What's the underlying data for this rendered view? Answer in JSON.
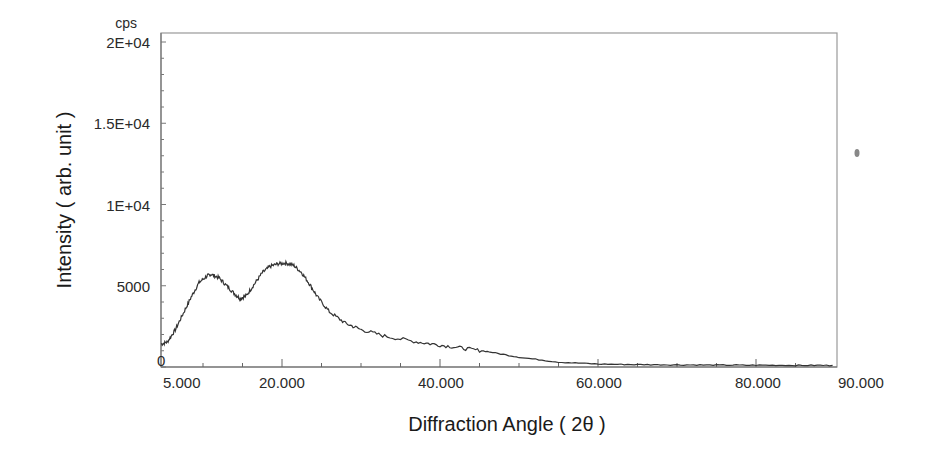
{
  "chart_data": {
    "type": "line",
    "title": "",
    "xlabel": "Diffraction Angle ( 2θ )",
    "ylabel": "Intensity ( arb. unit )",
    "y_unit": "cps",
    "xlim": [
      5,
      90
    ],
    "ylim": [
      0,
      20000
    ],
    "grid": false,
    "legend": null,
    "x_tick_labels": [
      "5.000",
      "20.000",
      "40.000",
      "60.000",
      "80.000",
      "90.000"
    ],
    "x_tick_values": [
      5,
      20,
      40,
      60,
      80,
      90
    ],
    "y_tick_labels": [
      "0",
      "5000",
      "1E+04",
      "1.5E+04",
      "2E+04"
    ],
    "y_tick_values": [
      0,
      5000,
      10000,
      15000,
      20000
    ],
    "series": [
      {
        "name": "XRD pattern",
        "x": [
          4.7,
          5.5,
          6.5,
          7.5,
          8.5,
          9.5,
          10.5,
          11.0,
          12.0,
          13.0,
          14.0,
          14.7,
          15.5,
          16.5,
          17.5,
          18.5,
          19.5,
          20.5,
          21.5,
          22.5,
          23.5,
          24.5,
          26.0,
          28.0,
          30.0,
          33.0,
          37.0,
          40.0,
          43.0,
          46.0,
          50.0,
          55.0,
          60.0,
          65.0,
          70.0,
          75.0,
          80.0,
          85.0,
          89.7
        ],
        "y": [
          1400,
          1550,
          2300,
          3300,
          4300,
          5200,
          5600,
          5700,
          5500,
          5000,
          4500,
          4200,
          4400,
          5100,
          5800,
          6200,
          6350,
          6400,
          6250,
          5800,
          5100,
          4300,
          3400,
          2700,
          2300,
          1900,
          1550,
          1350,
          1150,
          950,
          600,
          300,
          180,
          150,
          130,
          120,
          110,
          100,
          100
        ]
      }
    ]
  },
  "annotations": {
    "stray_mark": "smudge to the right of plot"
  }
}
